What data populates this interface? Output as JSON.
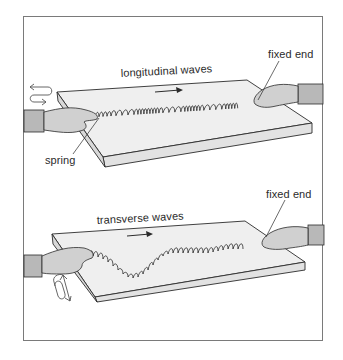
{
  "figure": {
    "top_panel": {
      "title_label": "longitudinal waves",
      "fixed_end_label": "fixed end",
      "spring_label": "spring",
      "motion": "back-and-forth (horizontal)",
      "wave_direction": "right"
    },
    "bottom_panel": {
      "title_label": "transverse waves",
      "fixed_end_label": "fixed end",
      "motion": "side-to-side (perpendicular)",
      "wave_direction": "right"
    }
  },
  "colors": {
    "line": "#2b2b2b",
    "slab_top": "#eeeeee",
    "slab_side": "#dcdcdc",
    "sleeve": "#b8b8b8",
    "skin": "#cfcfcf",
    "frame": "#7a7a7a"
  }
}
